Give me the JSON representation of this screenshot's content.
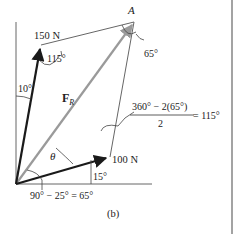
{
  "diagram": {
    "caption": "(b)",
    "point_label": "A",
    "resultant": {
      "label": "F",
      "subscript": "R",
      "color": "#9a9a9a"
    },
    "forces": [
      {
        "name": "force-150",
        "label": "150 N",
        "magnitude_N": 150,
        "angle_from_vertical_deg": 10
      },
      {
        "name": "force-100",
        "label": "100 N",
        "magnitude_N": 100,
        "angle_above_horizontal_deg": 15
      }
    ],
    "angles": {
      "top_left": "115°",
      "vertical_offset": "10°",
      "at_A": "65°",
      "bottom_right": "15°",
      "theta": "θ"
    },
    "equations": {
      "upper_numerator": "360° − 2(65°)",
      "upper_denominator": "2",
      "upper_result": "= 115°",
      "lower": "90° − 25° = 65°"
    },
    "colors": {
      "force": "#1a1a1a",
      "resultant": "#9a9a9a",
      "lines": "#555555"
    }
  }
}
